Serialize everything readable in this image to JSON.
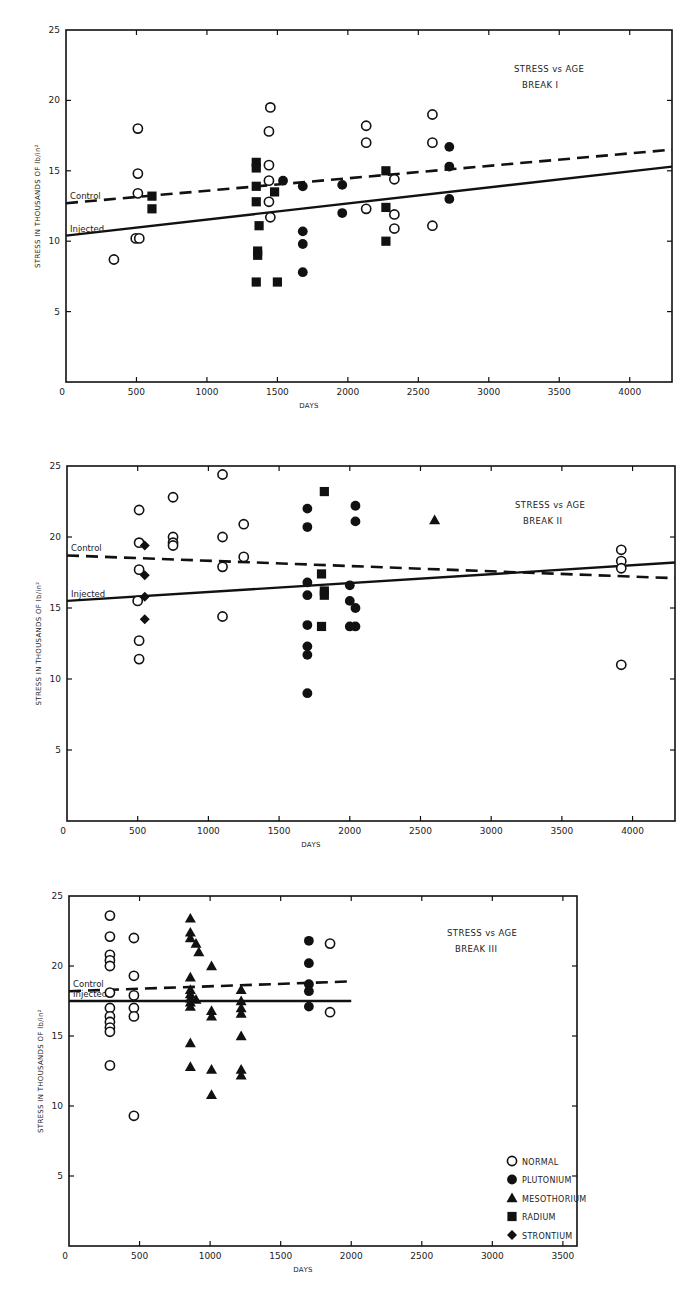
{
  "chart_data": [
    {
      "type": "scatter",
      "title": "STRESS vs AGE",
      "subtitle": "BREAK I",
      "xlabel": "DAYS",
      "ylabel": "STRESS IN THOUSANDS OF lb/in²",
      "xlim": [
        0,
        4300
      ],
      "ylim": [
        0,
        25
      ],
      "xticks": [
        0,
        500,
        1000,
        1500,
        2000,
        2500,
        3000,
        3500,
        4000
      ],
      "yticks": [
        0,
        5,
        10,
        15,
        20,
        25
      ],
      "grid": false,
      "legend_position": "none",
      "lines": [
        {
          "name": "Control",
          "style": "dashed",
          "x": [
            0,
            4300
          ],
          "y": [
            12.7,
            16.5
          ]
        },
        {
          "name": "Injected",
          "style": "solid",
          "x": [
            0,
            4300
          ],
          "y": [
            10.4,
            15.3
          ]
        }
      ],
      "series": [
        {
          "name": "NORMAL",
          "marker": "open-circle",
          "points": [
            [
              340,
              8.7
            ],
            [
              510,
              18.0
            ],
            [
              510,
              14.8
            ],
            [
              510,
              13.4
            ],
            [
              495,
              10.2
            ],
            [
              520,
              10.2
            ],
            [
              1450,
              19.5
            ],
            [
              1440,
              17.8
            ],
            [
              1440,
              15.4
            ],
            [
              1440,
              14.3
            ],
            [
              1440,
              12.8
            ],
            [
              1450,
              11.7
            ],
            [
              2130,
              18.2
            ],
            [
              2130,
              17.0
            ],
            [
              2130,
              12.3
            ],
            [
              2330,
              14.4
            ],
            [
              2330,
              11.9
            ],
            [
              2330,
              10.9
            ],
            [
              2600,
              19.0
            ],
            [
              2600,
              17.0
            ],
            [
              2600,
              11.1
            ]
          ]
        },
        {
          "name": "PLUTONIUM",
          "marker": "filled-circle",
          "points": [
            [
              1540,
              14.3
            ],
            [
              1680,
              13.9
            ],
            [
              1680,
              10.7
            ],
            [
              1680,
              9.8
            ],
            [
              1680,
              7.8
            ],
            [
              1960,
              14.0
            ],
            [
              1960,
              12.0
            ],
            [
              2720,
              16.7
            ],
            [
              2720,
              15.3
            ],
            [
              2720,
              13.0
            ]
          ]
        },
        {
          "name": "RADIUM",
          "marker": "filled-square",
          "points": [
            [
              610,
              13.2
            ],
            [
              610,
              12.3
            ],
            [
              1350,
              15.6
            ],
            [
              1350,
              15.2
            ],
            [
              1350,
              13.9
            ],
            [
              1350,
              12.8
            ],
            [
              1370,
              11.1
            ],
            [
              1360,
              9.3
            ],
            [
              1360,
              9.0
            ],
            [
              1350,
              7.1
            ],
            [
              1480,
              13.5
            ],
            [
              1500,
              7.1
            ],
            [
              2270,
              15.0
            ],
            [
              2270,
              12.4
            ],
            [
              2270,
              10.0
            ]
          ]
        }
      ]
    },
    {
      "type": "scatter",
      "title": "STRESS vs AGE",
      "subtitle": "BREAK II",
      "xlabel": "DAYS",
      "ylabel": "STRESS IN THOUSANDS OF lb/in²",
      "xlim": [
        0,
        4300
      ],
      "ylim": [
        0,
        25
      ],
      "xticks": [
        0,
        500,
        1000,
        1500,
        2000,
        2500,
        3000,
        3500,
        4000
      ],
      "yticks": [
        0,
        5,
        10,
        15,
        20,
        25
      ],
      "grid": false,
      "legend_position": "none",
      "lines": [
        {
          "name": "Control",
          "style": "dashed",
          "x": [
            0,
            4300
          ],
          "y": [
            18.7,
            17.1
          ]
        },
        {
          "name": "Injected",
          "style": "solid",
          "x": [
            0,
            4300
          ],
          "y": [
            15.5,
            18.2
          ]
        }
      ],
      "series": [
        {
          "name": "NORMAL",
          "marker": "open-circle",
          "points": [
            [
              510,
              21.9
            ],
            [
              510,
              19.6
            ],
            [
              510,
              17.7
            ],
            [
              500,
              15.5
            ],
            [
              510,
              12.7
            ],
            [
              510,
              11.4
            ],
            [
              750,
              22.8
            ],
            [
              750,
              20.0
            ],
            [
              750,
              19.6
            ],
            [
              750,
              19.4
            ],
            [
              1100,
              24.4
            ],
            [
              1100,
              20.0
            ],
            [
              1100,
              17.9
            ],
            [
              1100,
              14.4
            ],
            [
              1250,
              20.9
            ],
            [
              1250,
              18.6
            ],
            [
              3920,
              19.1
            ],
            [
              3920,
              18.3
            ],
            [
              3920,
              17.8
            ],
            [
              3920,
              11.0
            ]
          ]
        },
        {
          "name": "PLUTONIUM",
          "marker": "filled-circle",
          "points": [
            [
              1700,
              22.0
            ],
            [
              1700,
              20.7
            ],
            [
              1700,
              16.8
            ],
            [
              1700,
              15.9
            ],
            [
              1700,
              13.8
            ],
            [
              1700,
              12.3
            ],
            [
              1700,
              11.7
            ],
            [
              1700,
              9.0
            ],
            [
              2000,
              16.6
            ],
            [
              2000,
              15.5
            ],
            [
              2000,
              13.7
            ],
            [
              2040,
              22.2
            ],
            [
              2040,
              21.1
            ],
            [
              2040,
              15.0
            ],
            [
              2040,
              13.7
            ]
          ]
        },
        {
          "name": "RADIUM",
          "marker": "filled-square",
          "points": [
            [
              1820,
              23.2
            ],
            [
              1800,
              17.4
            ],
            [
              1820,
              16.2
            ],
            [
              1820,
              15.9
            ],
            [
              1800,
              13.7
            ]
          ]
        },
        {
          "name": "MESOTHORIUM",
          "marker": "filled-triangle",
          "points": [
            [
              2600,
              21.2
            ]
          ]
        },
        {
          "name": "STRONTIUM",
          "marker": "filled-diamond",
          "points": [
            [
              550,
              19.4
            ],
            [
              550,
              17.3
            ],
            [
              550,
              15.8
            ],
            [
              550,
              14.2
            ]
          ]
        }
      ]
    },
    {
      "type": "scatter",
      "title": "STRESS vs AGE",
      "subtitle": "BREAK III",
      "xlabel": "DAYS",
      "ylabel": "STRESS IN THOUSANDS OF lb/in²",
      "xlim": [
        0,
        3600
      ],
      "ylim": [
        0,
        25
      ],
      "xticks": [
        0,
        500,
        1000,
        1500,
        2000,
        2500,
        3000,
        3500
      ],
      "yticks": [
        0,
        5,
        10,
        15,
        20,
        25
      ],
      "grid": false,
      "legend_position": "lower right",
      "lines": [
        {
          "name": "Control",
          "style": "dashed",
          "x": [
            0,
            2000
          ],
          "y": [
            18.2,
            18.9
          ]
        },
        {
          "name": "Injected",
          "style": "solid",
          "x": [
            0,
            2000
          ],
          "y": [
            17.5,
            17.5
          ]
        }
      ],
      "series": [
        {
          "name": "NORMAL",
          "marker": "open-circle",
          "points": [
            [
              290,
              23.6
            ],
            [
              290,
              22.1
            ],
            [
              290,
              20.8
            ],
            [
              290,
              20.4
            ],
            [
              290,
              20.0
            ],
            [
              290,
              18.1
            ],
            [
              290,
              17.0
            ],
            [
              290,
              16.4
            ],
            [
              290,
              16.0
            ],
            [
              290,
              15.6
            ],
            [
              290,
              15.3
            ],
            [
              290,
              12.9
            ],
            [
              460,
              22.0
            ],
            [
              460,
              19.3
            ],
            [
              460,
              17.9
            ],
            [
              460,
              17.0
            ],
            [
              460,
              16.4
            ],
            [
              460,
              9.3
            ],
            [
              1850,
              21.6
            ],
            [
              1850,
              16.7
            ]
          ]
        },
        {
          "name": "PLUTONIUM",
          "marker": "filled-circle",
          "points": [
            [
              1700,
              21.8
            ],
            [
              1700,
              20.2
            ],
            [
              1700,
              18.7
            ],
            [
              1700,
              18.2
            ],
            [
              1700,
              17.1
            ]
          ]
        },
        {
          "name": "MESOTHORIUM",
          "marker": "filled-triangle",
          "points": [
            [
              860,
              23.4
            ],
            [
              860,
              22.4
            ],
            [
              860,
              22.0
            ],
            [
              860,
              19.2
            ],
            [
              860,
              18.3
            ],
            [
              860,
              18.0
            ],
            [
              860,
              17.7
            ],
            [
              860,
              17.4
            ],
            [
              860,
              17.1
            ],
            [
              860,
              14.5
            ],
            [
              860,
              12.8
            ],
            [
              900,
              21.6
            ],
            [
              900,
              17.6
            ],
            [
              920,
              21.0
            ],
            [
              1010,
              20.0
            ],
            [
              1010,
              16.8
            ],
            [
              1010,
              16.4
            ],
            [
              1010,
              12.6
            ],
            [
              1010,
              10.8
            ],
            [
              1220,
              18.3
            ],
            [
              1220,
              17.5
            ],
            [
              1220,
              17.0
            ],
            [
              1220,
              16.6
            ],
            [
              1220,
              15.0
            ],
            [
              1220,
              12.6
            ],
            [
              1220,
              12.2
            ]
          ]
        }
      ]
    }
  ],
  "legend": {
    "items": [
      {
        "label": "NORMAL",
        "marker": "open-circle"
      },
      {
        "label": "PLUTONIUM",
        "marker": "filled-circle"
      },
      {
        "label": "MESOTHORIUM",
        "marker": "filled-triangle"
      },
      {
        "label": "RADIUM",
        "marker": "filled-square"
      },
      {
        "label": "STRONTIUM",
        "marker": "filled-diamond"
      }
    ]
  },
  "labels": {
    "control": "Control",
    "injected": "Injected"
  },
  "layout": [
    {
      "left": 66,
      "top": 30,
      "right": 672,
      "bottom": 382,
      "xmax": 4300
    },
    {
      "left": 67,
      "top": 466,
      "right": 675,
      "bottom": 821,
      "xmax": 4300
    },
    {
      "left": 69,
      "top": 896,
      "right": 577,
      "bottom": 1246,
      "xmax": 3600
    }
  ],
  "colors": {
    "ink": "#111111",
    "paper": "#ffffff"
  }
}
